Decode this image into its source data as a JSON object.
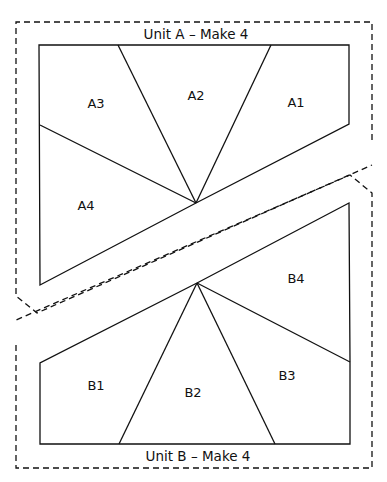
{
  "units": [
    {
      "id": "A",
      "title": "Unit A – Make 4",
      "pieces": [
        {
          "label": "A1",
          "x": 296,
          "y": 102
        },
        {
          "label": "A2",
          "x": 196,
          "y": 95
        },
        {
          "label": "A3",
          "x": 96,
          "y": 103
        },
        {
          "label": "A4",
          "x": 86,
          "y": 205
        }
      ]
    },
    {
      "id": "B",
      "title": "Unit B – Make 4",
      "pieces": [
        {
          "label": "B1",
          "x": 96,
          "y": 385
        },
        {
          "label": "B2",
          "x": 193,
          "y": 392
        },
        {
          "label": "B3",
          "x": 287,
          "y": 375
        },
        {
          "label": "B4",
          "x": 296,
          "y": 278
        }
      ]
    }
  ],
  "colors": {
    "line": "#111111",
    "background": "#ffffff"
  }
}
